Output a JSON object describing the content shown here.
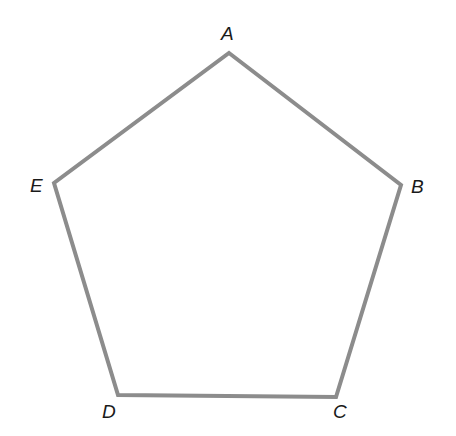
{
  "diagram": {
    "type": "regular-pentagon",
    "stroke_color": "#8c8c8c",
    "stroke_width": 4,
    "background": "#ffffff",
    "vertices": [
      {
        "name": "A",
        "x": 229,
        "y": 53
      },
      {
        "name": "B",
        "x": 401,
        "y": 185
      },
      {
        "name": "C",
        "x": 336,
        "y": 397
      },
      {
        "name": "D",
        "x": 118,
        "y": 395
      },
      {
        "name": "E",
        "x": 54,
        "y": 183
      }
    ],
    "labels": {
      "A": "A",
      "B": "B",
      "C": "C",
      "D": "D",
      "E": "E"
    }
  }
}
